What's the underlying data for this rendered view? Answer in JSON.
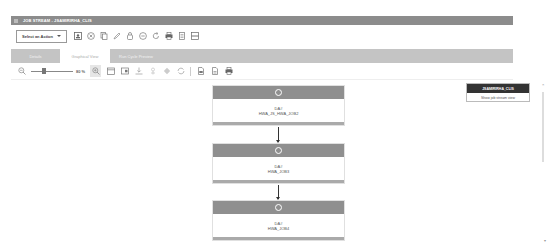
{
  "window": {
    "title": "JOB STREAM - JSAMIRIRHA_CLIS"
  },
  "toolbar": {
    "select_action_label": "Select an Action",
    "icons": [
      "properties-icon",
      "cancel-icon",
      "copy-icon",
      "edit-icon",
      "hold-icon",
      "release-icon",
      "rerun-icon",
      "print-icon",
      "document-icon",
      "layout-icon"
    ]
  },
  "tabs": [
    {
      "label": "Details",
      "active": false
    },
    {
      "label": "Graphical View",
      "active": true
    },
    {
      "label": "Run Cycle Preview",
      "active": false
    }
  ],
  "view_toolbar": {
    "zoom_percent": "80 %",
    "icons": [
      "zoom-fit-icon",
      "calendar-icon",
      "window-icon",
      "download-icon",
      "dependency-icon",
      "diamond-icon",
      "refresh-icon",
      "export-pdf-icon",
      "export-file-icon",
      "print-icon"
    ]
  },
  "nodes": [
    {
      "type": "DA#",
      "name": "HWA_JS_HWA_JOB2"
    },
    {
      "type": "DA#",
      "name": "HWA_JOB3"
    },
    {
      "type": "DA#",
      "name": "HWA_JOB4"
    }
  ],
  "popup": {
    "title": "JSAMIRIRHA_CLIS",
    "action": "Show job stream view"
  },
  "colors": {
    "titlebar": "#8c8c8c",
    "tabbar": "#c4c4c4",
    "node_header": "#8f8f8f",
    "popup_header": "#333333"
  }
}
